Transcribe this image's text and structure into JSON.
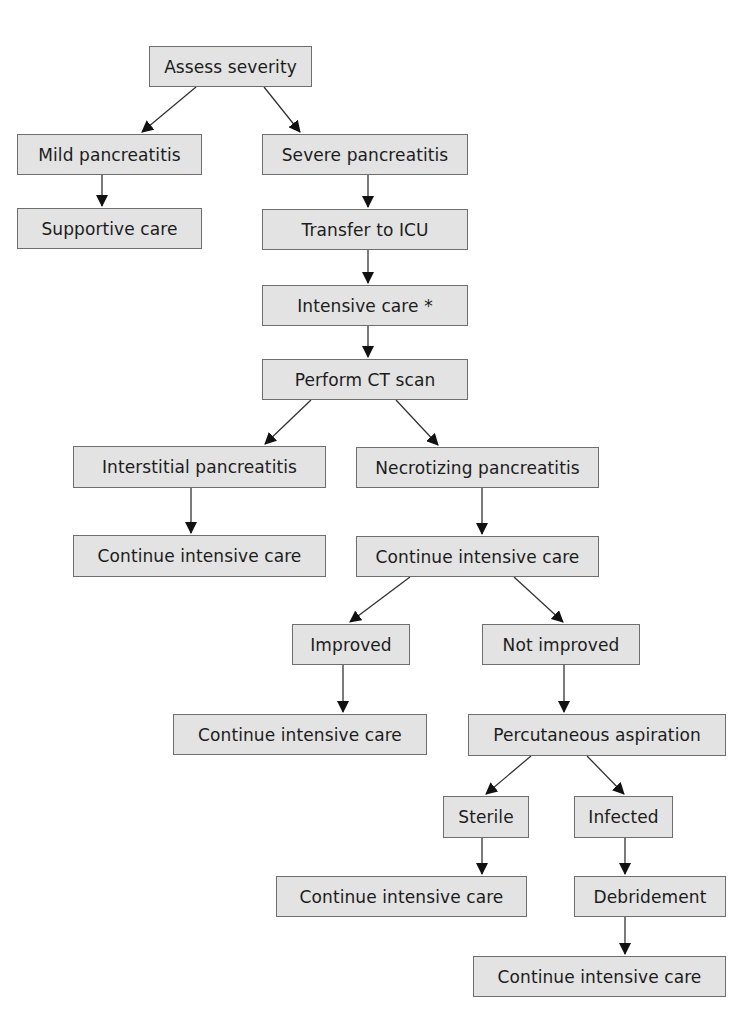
{
  "diagram": {
    "type": "flowchart",
    "background": "#ffffff",
    "node_fill": "#e3e3e3",
    "node_border": "#6e6e6e",
    "edge_color": "#333333",
    "nodes": [
      {
        "id": "assess",
        "label": "Assess severity",
        "x": 149,
        "y": 46,
        "w": 163,
        "h": 41
      },
      {
        "id": "mild",
        "label": "Mild pancreatitis",
        "x": 17,
        "y": 134,
        "w": 185,
        "h": 41
      },
      {
        "id": "severe",
        "label": "Severe pancreatitis",
        "x": 262,
        "y": 134,
        "w": 206,
        "h": 41
      },
      {
        "id": "supportive",
        "label": "Supportive care",
        "x": 17,
        "y": 208,
        "w": 185,
        "h": 41
      },
      {
        "id": "icu",
        "label": "Transfer to ICU",
        "x": 262,
        "y": 209,
        "w": 206,
        "h": 41
      },
      {
        "id": "intensive",
        "label": "Intensive care *",
        "x": 262,
        "y": 285,
        "w": 206,
        "h": 41
      },
      {
        "id": "ct",
        "label": "Perform CT scan",
        "x": 262,
        "y": 359,
        "w": 206,
        "h": 41
      },
      {
        "id": "interstitial",
        "label": "Interstitial pancreatitis",
        "x": 73,
        "y": 446,
        "w": 253,
        "h": 42
      },
      {
        "id": "necrotizing",
        "label": "Necrotizing pancreatitis",
        "x": 356,
        "y": 447,
        "w": 243,
        "h": 41
      },
      {
        "id": "cont1",
        "label": "Continue intensive care",
        "x": 73,
        "y": 535,
        "w": 253,
        "h": 42
      },
      {
        "id": "cont2",
        "label": "Continue intensive care",
        "x": 356,
        "y": 536,
        "w": 243,
        "h": 41
      },
      {
        "id": "improved",
        "label": "Improved",
        "x": 292,
        "y": 624,
        "w": 118,
        "h": 41
      },
      {
        "id": "notimproved",
        "label": "Not improved",
        "x": 482,
        "y": 624,
        "w": 158,
        "h": 41
      },
      {
        "id": "cont3",
        "label": "Continue intensive care",
        "x": 173,
        "y": 714,
        "w": 254,
        "h": 41
      },
      {
        "id": "aspiration",
        "label": "Percutaneous aspiration",
        "x": 468,
        "y": 714,
        "w": 258,
        "h": 42
      },
      {
        "id": "sterile",
        "label": "Sterile",
        "x": 443,
        "y": 796,
        "w": 86,
        "h": 42
      },
      {
        "id": "infected",
        "label": "Infected",
        "x": 574,
        "y": 796,
        "w": 99,
        "h": 42
      },
      {
        "id": "cont4",
        "label": "Continue intensive care",
        "x": 276,
        "y": 876,
        "w": 251,
        "h": 41
      },
      {
        "id": "debridement",
        "label": "Debridement",
        "x": 574,
        "y": 876,
        "w": 152,
        "h": 41
      },
      {
        "id": "cont5",
        "label": "Continue intensive care",
        "x": 473,
        "y": 956,
        "w": 253,
        "h": 41
      }
    ],
    "edges": [
      {
        "from": "assess",
        "to": "mild",
        "x1": 196,
        "y1": 87,
        "x2": 142,
        "y2": 132
      },
      {
        "from": "assess",
        "to": "severe",
        "x1": 264,
        "y1": 87,
        "x2": 300,
        "y2": 132
      },
      {
        "from": "mild",
        "to": "supportive",
        "x1": 102,
        "y1": 175,
        "x2": 102,
        "y2": 206
      },
      {
        "from": "severe",
        "to": "icu",
        "x1": 368,
        "y1": 175,
        "x2": 368,
        "y2": 207
      },
      {
        "from": "icu",
        "to": "intensive",
        "x1": 368,
        "y1": 250,
        "x2": 368,
        "y2": 283
      },
      {
        "from": "intensive",
        "to": "ct",
        "x1": 368,
        "y1": 326,
        "x2": 368,
        "y2": 357
      },
      {
        "from": "ct",
        "to": "interstitial",
        "x1": 311,
        "y1": 400,
        "x2": 265,
        "y2": 444
      },
      {
        "from": "ct",
        "to": "necrotizing",
        "x1": 396,
        "y1": 400,
        "x2": 438,
        "y2": 445
      },
      {
        "from": "interstitial",
        "to": "cont1",
        "x1": 191,
        "y1": 488,
        "x2": 191,
        "y2": 533
      },
      {
        "from": "necrotizing",
        "to": "cont2",
        "x1": 482,
        "y1": 488,
        "x2": 482,
        "y2": 534
      },
      {
        "from": "cont2",
        "to": "improved",
        "x1": 410,
        "y1": 577,
        "x2": 350,
        "y2": 622
      },
      {
        "from": "cont2",
        "to": "notimproved",
        "x1": 514,
        "y1": 577,
        "x2": 563,
        "y2": 622
      },
      {
        "from": "improved",
        "to": "cont3",
        "x1": 343,
        "y1": 665,
        "x2": 343,
        "y2": 712
      },
      {
        "from": "notimproved",
        "to": "aspiration",
        "x1": 564,
        "y1": 665,
        "x2": 564,
        "y2": 712
      },
      {
        "from": "aspiration",
        "to": "sterile",
        "x1": 531,
        "y1": 756,
        "x2": 486,
        "y2": 794
      },
      {
        "from": "aspiration",
        "to": "infected",
        "x1": 587,
        "y1": 756,
        "x2": 624,
        "y2": 794
      },
      {
        "from": "sterile",
        "to": "cont4",
        "x1": 482,
        "y1": 838,
        "x2": 482,
        "y2": 874
      },
      {
        "from": "infected",
        "to": "debridement",
        "x1": 625,
        "y1": 838,
        "x2": 625,
        "y2": 874
      },
      {
        "from": "debridement",
        "to": "cont5",
        "x1": 625,
        "y1": 917,
        "x2": 625,
        "y2": 954
      }
    ]
  }
}
